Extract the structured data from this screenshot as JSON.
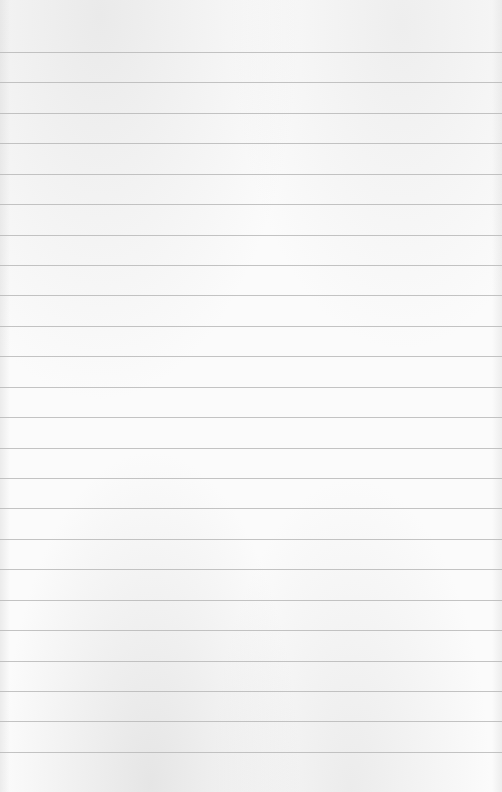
{
  "page": {
    "type": "lined-paper",
    "ruled_line_count": 24,
    "text_content": "",
    "colors": {
      "paper": "#fbfbfb",
      "rule": "#b9b9b9"
    }
  }
}
